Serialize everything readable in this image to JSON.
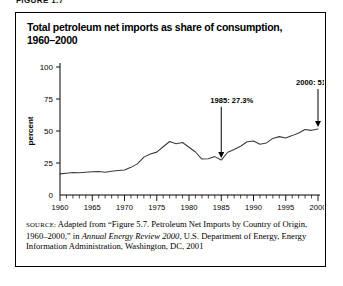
{
  "figure_label": "FIGURE 1.7",
  "chart_title": "Total petroleum net imports as share of consumption, 1960–2000",
  "source": {
    "label": "SOURCE:",
    "text_before_italic": " Adapted from “Figure 5.7. Petroleum Net Imports by Country of Origin, 1960–2000,” in ",
    "italic_title": "Annual Energy Review 2000",
    "text_after_italic": ", U.S. Department of Energy, Energy Information Administration, Washington, DC, 2001"
  },
  "chart_data": {
    "type": "line",
    "title": "Total petroleum net imports as share of consumption, 1960–2000",
    "xlabel": "",
    "ylabel": "percent",
    "xlim": [
      1960,
      2000
    ],
    "ylim": [
      0,
      100
    ],
    "ytick_values": [
      0,
      25,
      50,
      75,
      100
    ],
    "ytick_labels": [
      "0",
      "25",
      "50",
      "75",
      "100"
    ],
    "xtick_values": [
      1960,
      1965,
      1970,
      1975,
      1980,
      1985,
      1990,
      1995,
      2000
    ],
    "xtick_labels": [
      "1960",
      "1965",
      "1970",
      "1975",
      "1980",
      "1985",
      "1990",
      "1995",
      "2000"
    ],
    "minor_xticks_every": 1,
    "grid": false,
    "legend": false,
    "series": [
      {
        "name": "Petroleum net imports as share of consumption",
        "color": "#3a3a3a",
        "x": [
          1960,
          1961,
          1962,
          1963,
          1964,
          1965,
          1966,
          1967,
          1968,
          1969,
          1970,
          1971,
          1972,
          1973,
          1974,
          1975,
          1976,
          1977,
          1978,
          1979,
          1980,
          1981,
          1982,
          1983,
          1984,
          1985,
          1986,
          1987,
          1988,
          1989,
          1990,
          1991,
          1992,
          1993,
          1994,
          1995,
          1996,
          1997,
          1998,
          1999,
          2000
        ],
        "values": [
          16.5,
          17.0,
          17.6,
          17.4,
          17.8,
          18.2,
          18.4,
          17.8,
          18.6,
          19.2,
          19.5,
          21.6,
          24.3,
          29.6,
          32.1,
          33.5,
          37.7,
          41.8,
          40.0,
          41.0,
          37.3,
          33.6,
          28.1,
          28.3,
          30.0,
          27.3,
          33.4,
          35.5,
          38.1,
          41.6,
          42.2,
          39.6,
          40.7,
          44.2,
          45.6,
          44.5,
          46.4,
          48.5,
          51.2,
          50.5,
          51.6
        ]
      }
    ],
    "annotations": [
      {
        "id": "annot-1985",
        "text": "1985: 27.3%",
        "year": 1985,
        "value": 27.3,
        "label_x": 1983.3,
        "label_y": 72
      },
      {
        "id": "annot-2000",
        "text": "2000: 51.6%",
        "year": 2000,
        "value": 51.6,
        "label_x": 1996.6,
        "label_y": 86
      }
    ]
  }
}
